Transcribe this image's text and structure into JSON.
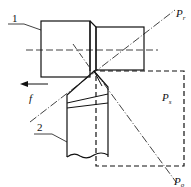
{
  "figure": {
    "type": "turning tool reference planes diagram",
    "parts": [
      {
        "id": "1",
        "label": "1",
        "meaning": "workpiece"
      },
      {
        "id": "2",
        "label": "2",
        "meaning": "turning tool"
      }
    ],
    "feed": {
      "symbol": "f",
      "direction": "left"
    },
    "planes": [
      {
        "symbol": "P",
        "subscript": "r",
        "line": "dash-dot diagonal up-right"
      },
      {
        "symbol": "P",
        "subscript": "s",
        "line": "dashed rectangle"
      },
      {
        "symbol": "P",
        "subscript": "o",
        "line": "dash-dot diagonal down-right"
      }
    ],
    "colors": {
      "ink": "#111111",
      "background": "#ffffff"
    }
  }
}
